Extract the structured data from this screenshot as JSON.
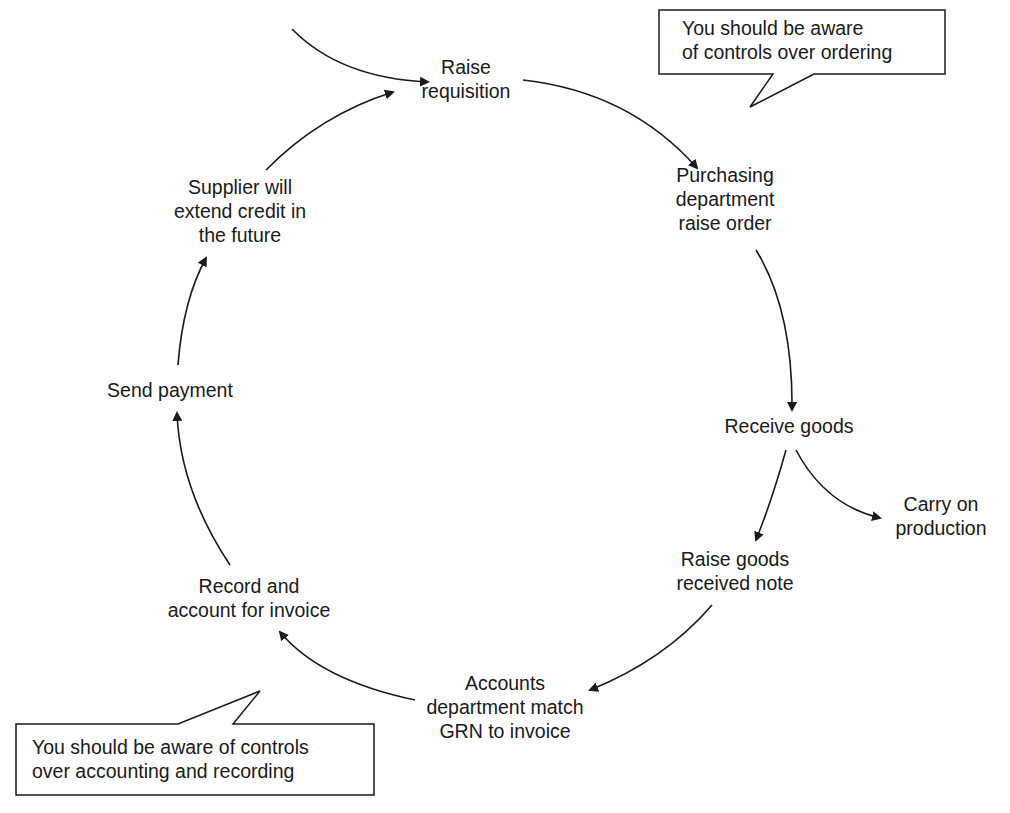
{
  "diagram": {
    "type": "cycle",
    "nodes": [
      {
        "id": "raise-requisition",
        "lines": [
          "Raise",
          "requisition"
        ]
      },
      {
        "id": "purchasing-raise-order",
        "lines": [
          "Purchasing",
          "department",
          "raise order"
        ]
      },
      {
        "id": "receive-goods",
        "lines": [
          "Receive goods"
        ]
      },
      {
        "id": "carry-on-production",
        "lines": [
          "Carry on",
          "production"
        ]
      },
      {
        "id": "raise-grn",
        "lines": [
          "Raise goods",
          "received note"
        ]
      },
      {
        "id": "accounts-match",
        "lines": [
          "Accounts",
          "department match",
          "GRN to invoice"
        ]
      },
      {
        "id": "record-invoice",
        "lines": [
          "Record and",
          "account for invoice"
        ]
      },
      {
        "id": "send-payment",
        "lines": [
          "Send payment"
        ]
      },
      {
        "id": "supplier-credit",
        "lines": [
          "Supplier will",
          "extend credit in",
          "the future"
        ]
      }
    ],
    "edges": [
      {
        "from": "start",
        "to": "raise-requisition"
      },
      {
        "from": "raise-requisition",
        "to": "purchasing-raise-order"
      },
      {
        "from": "purchasing-raise-order",
        "to": "receive-goods"
      },
      {
        "from": "receive-goods",
        "to": "raise-grn"
      },
      {
        "from": "receive-goods",
        "to": "carry-on-production"
      },
      {
        "from": "raise-grn",
        "to": "accounts-match"
      },
      {
        "from": "accounts-match",
        "to": "record-invoice"
      },
      {
        "from": "record-invoice",
        "to": "send-payment"
      },
      {
        "from": "send-payment",
        "to": "supplier-credit"
      },
      {
        "from": "supplier-credit",
        "to": "raise-requisition"
      }
    ],
    "callouts": [
      {
        "id": "ordering-callout",
        "lines": [
          "You should be aware",
          "of controls over ordering"
        ]
      },
      {
        "id": "accounting-callout",
        "lines": [
          "You should be aware of controls",
          "over accounting and recording"
        ]
      }
    ],
    "colors": {
      "line": "#1a1a1a",
      "background": "#ffffff"
    }
  }
}
